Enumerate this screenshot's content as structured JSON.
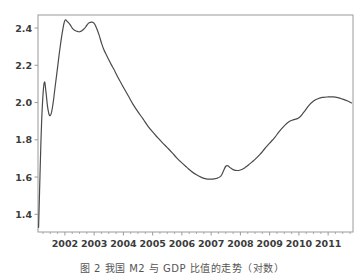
{
  "figure": {
    "caption": "图 2 我国 M2 与 GDP 比值的走势（对数）",
    "background_color": "#ffffff",
    "line_color": "#4a4a4a",
    "axis_color": "#9a9a9a"
  },
  "chart_data": {
    "type": "line",
    "title": "",
    "subtitle": "",
    "xlabel": "",
    "ylabel": "",
    "grid": false,
    "legend": null,
    "xlim": [
      2001.08,
      2011.85
    ],
    "ylim": [
      1.305,
      2.47
    ],
    "xticks": [
      2002,
      2003,
      2004,
      2005,
      2006,
      2007,
      2008,
      2009,
      2010,
      2011
    ],
    "xtick_labels": [
      "2002",
      "2003",
      "2004",
      "2005",
      "2006",
      "2007",
      "2008",
      "2009",
      "2010",
      "2011"
    ],
    "yticks": [
      1.4,
      1.6,
      1.8,
      2.0,
      2.2,
      2.4
    ],
    "ytick_labels": [
      "1.4",
      "1.6",
      "1.8",
      "2.0",
      "2.2",
      "2.4"
    ],
    "minor_xtick_interval": 0.25,
    "series": [
      {
        "name": "series-1",
        "color": "#4a4a4a",
        "linewidth": 1.2,
        "x": [
          2001.1,
          2001.15,
          2001.2,
          2001.25,
          2001.3,
          2001.35,
          2001.42,
          2001.5,
          2001.58,
          2001.67,
          2001.75,
          2001.83,
          2001.92,
          2002.0,
          2002.08,
          2002.17,
          2002.25,
          2002.33,
          2002.42,
          2002.5,
          2002.58,
          2002.67,
          2002.75,
          2002.83,
          2002.92,
          2003.0,
          2003.08,
          2003.17,
          2003.25,
          2003.33,
          2003.42,
          2003.5,
          2003.58,
          2003.67,
          2003.75,
          2003.83,
          2003.92,
          2004.0,
          2004.17,
          2004.33,
          2004.5,
          2004.67,
          2004.83,
          2005.0,
          2005.17,
          2005.33,
          2005.5,
          2005.67,
          2005.83,
          2006.0,
          2006.17,
          2006.33,
          2006.5,
          2006.67,
          2006.83,
          2007.0,
          2007.17,
          2007.33,
          2007.42,
          2007.5,
          2007.58,
          2007.67,
          2007.83,
          2008.0,
          2008.17,
          2008.33,
          2008.5,
          2008.67,
          2008.83,
          2009.0,
          2009.17,
          2009.33,
          2009.5,
          2009.67,
          2009.83,
          2010.0,
          2010.17,
          2010.33,
          2010.5,
          2010.67,
          2010.83,
          2011.0,
          2011.17,
          2011.33,
          2011.5,
          2011.67,
          2011.8
        ],
        "y": [
          1.33,
          1.62,
          1.88,
          2.04,
          2.11,
          2.06,
          1.965,
          1.93,
          1.98,
          2.09,
          2.19,
          2.29,
          2.385,
          2.44,
          2.435,
          2.42,
          2.4,
          2.388,
          2.382,
          2.38,
          2.385,
          2.398,
          2.415,
          2.428,
          2.432,
          2.425,
          2.4,
          2.362,
          2.32,
          2.285,
          2.255,
          2.23,
          2.205,
          2.18,
          2.155,
          2.13,
          2.105,
          2.082,
          2.035,
          1.99,
          1.95,
          1.912,
          1.875,
          1.842,
          1.812,
          1.785,
          1.758,
          1.73,
          1.702,
          1.676,
          1.652,
          1.63,
          1.612,
          1.598,
          1.59,
          1.589,
          1.592,
          1.605,
          1.632,
          1.658,
          1.66,
          1.648,
          1.636,
          1.638,
          1.652,
          1.672,
          1.695,
          1.722,
          1.752,
          1.782,
          1.812,
          1.845,
          1.875,
          1.898,
          1.908,
          1.918,
          1.948,
          1.982,
          2.008,
          2.022,
          2.028,
          2.03,
          2.03,
          2.026,
          2.018,
          2.008,
          1.998
        ]
      }
    ]
  }
}
